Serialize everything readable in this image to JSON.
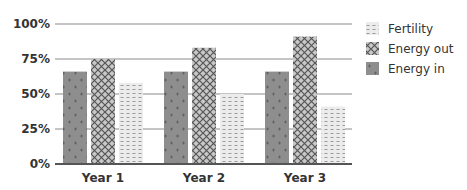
{
  "chart_data": {
    "type": "bar",
    "title": "",
    "xlabel": "",
    "ylabel": "",
    "categories": [
      "Year 1",
      "Year 2",
      "Year 3"
    ],
    "series": [
      {
        "name": "Energy in",
        "values": [
          66,
          66,
          66
        ],
        "color": "#8c8c8c",
        "pattern": "plus"
      },
      {
        "name": "Energy out",
        "values": [
          75,
          83,
          91
        ],
        "color": "#b4b4b4",
        "pattern": "crosshatch"
      },
      {
        "name": "Fertility",
        "values": [
          58,
          50,
          41
        ],
        "color": "#e6e6e6",
        "pattern": "dashes"
      }
    ],
    "ylim": [
      0,
      100
    ],
    "yticks": [
      "0%",
      "25%",
      "50%",
      "75%",
      "100%"
    ],
    "grid": true,
    "legend": {
      "position": "right",
      "entries": [
        "Fertility",
        "Energy out",
        "Energy in"
      ]
    }
  }
}
